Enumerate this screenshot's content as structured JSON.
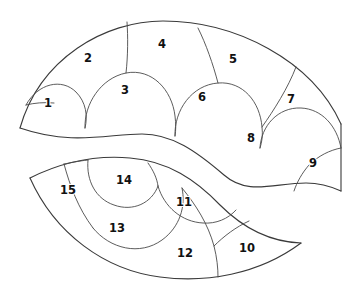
{
  "figure": {
    "background_color": "#ffffff",
    "outline_color": "#3a3a3a",
    "divider_color": "#4a4a4a",
    "label_color": "#111111",
    "canvas": {
      "width": 360,
      "height": 295
    }
  },
  "shapes": [
    {
      "name": "upper-crescent",
      "cell_count": 9,
      "cell_numbers": [
        1,
        2,
        3,
        4,
        5,
        6,
        7,
        8,
        9
      ]
    },
    {
      "name": "lower-crescent",
      "cell_count": 6,
      "cell_numbers": [
        10,
        11,
        12,
        13,
        14,
        15
      ]
    }
  ],
  "cells": [
    {
      "id": "cell-1",
      "label": "1",
      "x": 48,
      "y": 103,
      "shape": "upper-crescent"
    },
    {
      "id": "cell-2",
      "label": "2",
      "x": 88,
      "y": 58,
      "shape": "upper-crescent"
    },
    {
      "id": "cell-3",
      "label": "3",
      "x": 125,
      "y": 90,
      "shape": "upper-crescent"
    },
    {
      "id": "cell-4",
      "label": "4",
      "x": 162,
      "y": 44,
      "shape": "upper-crescent"
    },
    {
      "id": "cell-5",
      "label": "5",
      "x": 233,
      "y": 59,
      "shape": "upper-crescent"
    },
    {
      "id": "cell-6",
      "label": "6",
      "x": 202,
      "y": 97,
      "shape": "upper-crescent"
    },
    {
      "id": "cell-7",
      "label": "7",
      "x": 291,
      "y": 99,
      "shape": "upper-crescent"
    },
    {
      "id": "cell-8",
      "label": "8",
      "x": 251,
      "y": 138,
      "shape": "upper-crescent"
    },
    {
      "id": "cell-9",
      "label": "9",
      "x": 313,
      "y": 163,
      "shape": "upper-crescent"
    },
    {
      "id": "cell-10",
      "label": "10",
      "x": 247,
      "y": 248,
      "shape": "lower-crescent"
    },
    {
      "id": "cell-11",
      "label": "11",
      "x": 184,
      "y": 202,
      "shape": "lower-crescent"
    },
    {
      "id": "cell-12",
      "label": "12",
      "x": 185,
      "y": 253,
      "shape": "lower-crescent"
    },
    {
      "id": "cell-13",
      "label": "13",
      "x": 117,
      "y": 228,
      "shape": "lower-crescent"
    },
    {
      "id": "cell-14",
      "label": "14",
      "x": 124,
      "y": 180,
      "shape": "lower-crescent"
    },
    {
      "id": "cell-15",
      "label": "15",
      "x": 68,
      "y": 190,
      "shape": "lower-crescent"
    }
  ]
}
